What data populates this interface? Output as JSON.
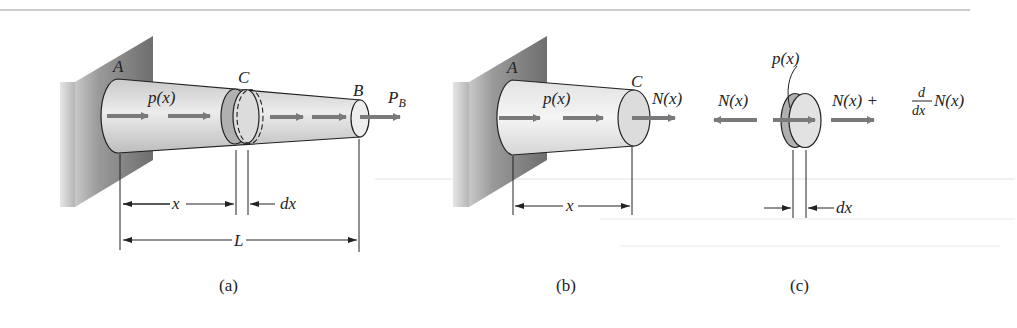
{
  "figure": {
    "colors": {
      "arrow": "#7a7a7a",
      "bar_fill": "#d9d9d9",
      "wall_fill": "#8c8c8c",
      "line": "#222222",
      "top_rule": "#9a9a9a"
    },
    "panels": [
      {
        "id": "a",
        "caption": "(a)",
        "labels": {
          "point_a": "A",
          "point_c": "C",
          "point_b": "B",
          "load": "p(x)",
          "end_load": "P",
          "end_load_sub": "B",
          "dim_x": "x",
          "dim_dx": "dx",
          "dim_L": "L"
        }
      },
      {
        "id": "b",
        "caption": "(b)",
        "labels": {
          "point_a": "A",
          "point_c": "C",
          "load": "p(x)",
          "internal_force": "N(x)",
          "dim_x": "x"
        }
      },
      {
        "id": "c",
        "caption": "(c)",
        "labels": {
          "load": "p(x)",
          "left_force": "N(x)",
          "right_force_a": "N(x) + ",
          "deriv_num": "d",
          "deriv_den": "dx",
          "right_force_b": "N(x)",
          "dim_dx": "dx"
        }
      }
    ]
  }
}
